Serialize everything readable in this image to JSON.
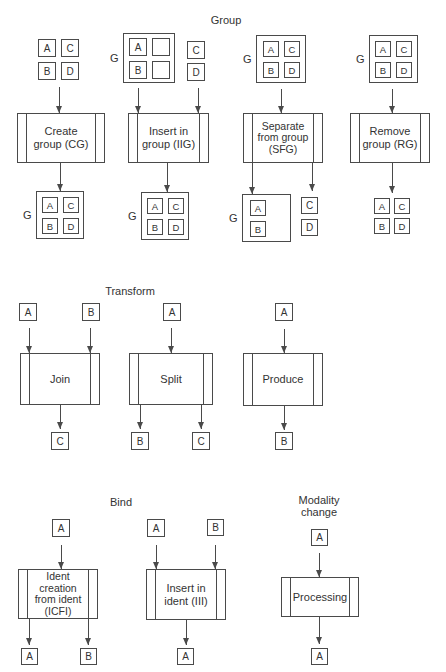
{
  "labels": {
    "g": "G",
    "a": "A",
    "b": "B",
    "c": "C",
    "d": "D"
  },
  "sections": {
    "group": {
      "title": "Group",
      "processes": {
        "create_group": [
          "Create",
          "group (CG)"
        ],
        "insert_in_group": [
          "Insert in",
          "group (IIG)"
        ],
        "separate_from_group": [
          "Separate",
          "from group",
          "(SFG)"
        ],
        "remove_group": [
          "Remove",
          "group (RG)"
        ]
      }
    },
    "transform": {
      "title": "Transform",
      "processes": {
        "join": [
          "Join"
        ],
        "split": [
          "Split"
        ],
        "produce": [
          "Produce"
        ]
      }
    },
    "bind": {
      "title": "Bind",
      "processes": {
        "ident_creation_from_ident": [
          "Ident",
          "creation",
          "from ident",
          "(ICFI)"
        ],
        "insert_in_ident": [
          "Insert in",
          "ident (III)"
        ]
      }
    },
    "modality_change": {
      "title_lines": [
        "Modality",
        "change"
      ],
      "processes": {
        "processing": [
          "Processing"
        ]
      }
    }
  },
  "colors": {
    "line": "#4a4a4a",
    "text": "#333333",
    "background": "#ffffff"
  }
}
